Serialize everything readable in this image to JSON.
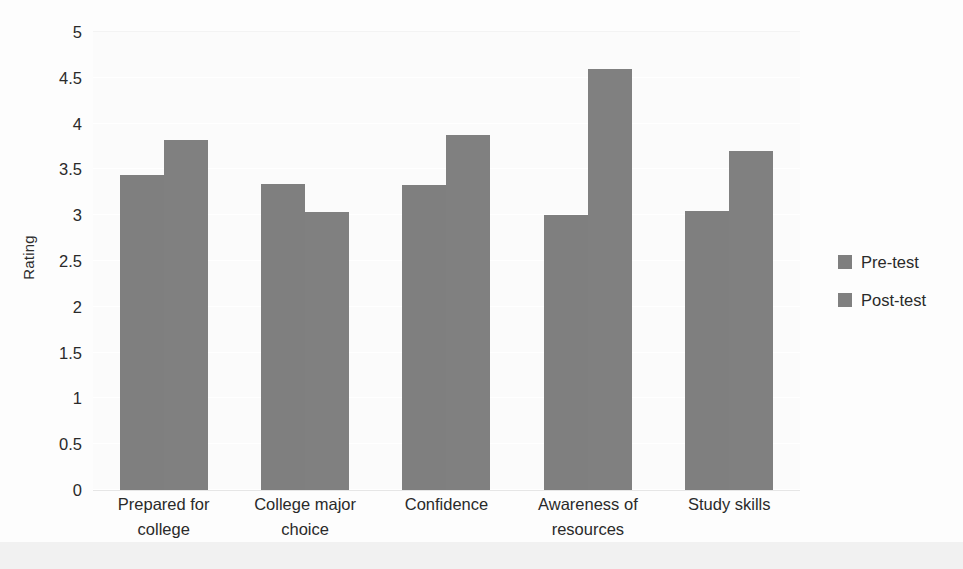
{
  "chart_data": {
    "type": "bar",
    "title": "",
    "subtitle": "",
    "xlabel": "",
    "ylabel": "Rating",
    "categories": [
      "Prepared for college",
      "College major choice",
      "Confidence",
      "Awareness of resources",
      "Study skills"
    ],
    "series": [
      {
        "name": "Pre-test",
        "values": [
          3.44,
          3.34,
          3.33,
          3.0,
          3.05
        ],
        "color": "#7f7f7f"
      },
      {
        "name": "Post-test",
        "values": [
          3.82,
          3.04,
          3.88,
          4.6,
          3.7
        ],
        "color": "#808080"
      }
    ],
    "ylim": [
      0,
      5
    ],
    "ytick_labels": [
      "0",
      "0.5",
      "1",
      "1.5",
      "2",
      "2.5",
      "3",
      "3.5",
      "4",
      "4.5",
      "5"
    ],
    "ytick_values": [
      0,
      0.5,
      1,
      1.5,
      2,
      2.5,
      3,
      3.5,
      4,
      4.5,
      5
    ],
    "grid": true,
    "grid_color": "#ffffff",
    "legend_position": "right",
    "plot_background": "#fbfbfb",
    "figure_background": "#fdfdfd",
    "axis_color": "#e6e6e6",
    "text_color": "#2a2a2a"
  },
  "legend": {
    "items": [
      {
        "label": "Pre-test",
        "color": "#7f7f7f"
      },
      {
        "label": "Post-test",
        "color": "#808080"
      }
    ]
  }
}
